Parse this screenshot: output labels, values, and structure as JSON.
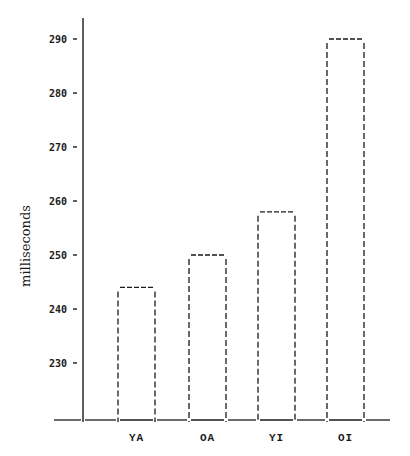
{
  "chart_data": {
    "type": "bar",
    "title": "",
    "xlabel": "",
    "ylabel": "milliseconds",
    "categories": [
      "YA",
      "OA",
      "YI",
      "OI"
    ],
    "values": [
      244,
      250,
      258,
      290
    ],
    "yticks": [
      230,
      240,
      250,
      260,
      270,
      280,
      290
    ],
    "ylim": [
      219.5,
      293
    ],
    "grid": false,
    "legend": null,
    "bar_style": "dashed outline, no fill",
    "colors": {
      "ink": "#1a1a1a",
      "background": "#ffffff"
    }
  }
}
